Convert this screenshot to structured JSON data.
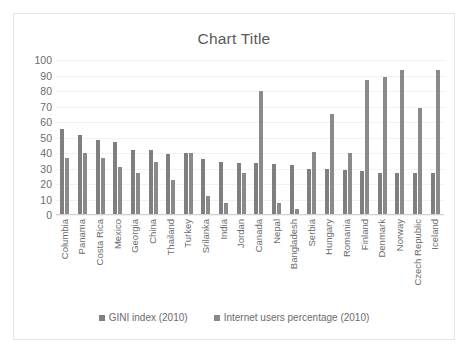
{
  "chart_data": {
    "type": "bar",
    "title": "Chart Title",
    "xlabel": "",
    "ylabel": "",
    "ylim": [
      0,
      100
    ],
    "yticks": [
      100,
      90,
      80,
      70,
      60,
      50,
      40,
      30,
      20,
      10,
      0
    ],
    "grid": true,
    "legend_position": "bottom",
    "categories": [
      "Columbia",
      "Panama",
      "Costa Rica",
      "Mexico",
      "Georgia",
      "China",
      "Thailand",
      "Turkey",
      "Srilanka",
      "India",
      "Jordan",
      "Canada",
      "Nepal",
      "Bangladesh",
      "Serbia",
      "Hungary",
      "Romania",
      "Finland",
      "Denmark",
      "Norway",
      "Czech Republic",
      "Iceland"
    ],
    "series": [
      {
        "name": "GINI index (2010)",
        "color": "#7f7f7f",
        "values": [
          55.5,
          51.9,
          48.1,
          47.2,
          42.1,
          42.1,
          39.4,
          40.0,
          36.4,
          33.9,
          33.7,
          33.7,
          32.8,
          32.1,
          29.7,
          29.4,
          28.8,
          28.5,
          27.2,
          27.1,
          26.9,
          26.8
        ]
      },
      {
        "name": "Internet users percentage (2010)",
        "color": "#8a8a8a",
        "values": [
          36.5,
          40.1,
          36.5,
          31.1,
          26.9,
          34.3,
          22.4,
          39.8,
          12.0,
          7.5,
          27.2,
          80.3,
          7.9,
          3.7,
          40.9,
          65.0,
          39.9,
          86.9,
          88.8,
          93.4,
          68.8,
          93.4
        ]
      }
    ]
  },
  "legend": {
    "entries": [
      {
        "label": "GINI index (2010)"
      },
      {
        "label": "Internet users percentage (2010)"
      }
    ]
  }
}
